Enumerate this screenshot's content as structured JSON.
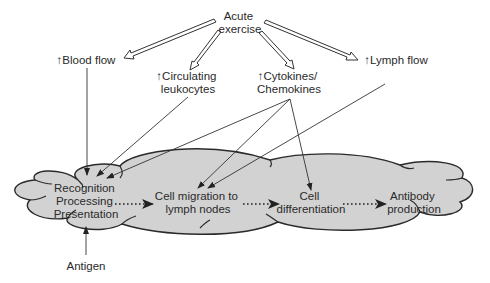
{
  "diagram": {
    "colors": {
      "cloud_fill": "#d2d2d2",
      "cloud_stroke": "#2a2a2a",
      "line": "#333333",
      "text": "#2a2a2a"
    },
    "source": {
      "line1": "Acute",
      "line2": "exercise"
    },
    "effects": {
      "blood_flow": "↑Blood flow",
      "leukocytes": {
        "line1": "↑Circulating",
        "line2": "leukocytes"
      },
      "cytokines": {
        "line1": "↑Cytokines/",
        "line2": "Chemokines"
      },
      "lymph_flow": "↑Lymph flow"
    },
    "stages": [
      {
        "lines": [
          "Recognition",
          "Processing",
          "Presentation"
        ]
      },
      {
        "lines": [
          "Cell migration to",
          "lymph nodes"
        ]
      },
      {
        "lines": [
          "Cell",
          "differentiation"
        ]
      },
      {
        "lines": [
          "Antibody",
          "production"
        ]
      }
    ],
    "antigen": "Antigen"
  }
}
